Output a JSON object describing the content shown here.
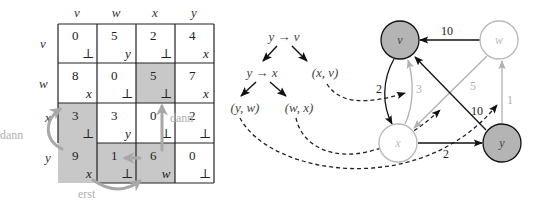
{
  "matrix": {
    "col_headers": [
      "v",
      "w",
      "x",
      "y"
    ],
    "row_headers": [
      "v",
      "w",
      "x",
      "y"
    ],
    "cells": [
      [
        {
          "d": "0",
          "p": "⊥"
        },
        {
          "d": "5",
          "p": "y"
        },
        {
          "d": "2",
          "p": "⊥"
        },
        {
          "d": "4",
          "p": "x"
        }
      ],
      [
        {
          "d": "8",
          "p": "x"
        },
        {
          "d": "0",
          "p": "⊥"
        },
        {
          "d": "5",
          "p": "⊥"
        },
        {
          "d": "7",
          "p": "x"
        }
      ],
      [
        {
          "d": "3",
          "p": "⊥"
        },
        {
          "d": "3",
          "p": "y"
        },
        {
          "d": "0",
          "p": "⊥"
        },
        {
          "d": "2",
          "p": "⊥"
        }
      ],
      [
        {
          "d": "9",
          "p": "x"
        },
        {
          "d": "1",
          "p": "⊥"
        },
        {
          "d": "6",
          "p": "w"
        },
        {
          "d": "0",
          "p": "⊥"
        }
      ]
    ],
    "shaded": [
      [
        1,
        2
      ],
      [
        2,
        0
      ],
      [
        3,
        0
      ],
      [
        3,
        1
      ],
      [
        3,
        2
      ]
    ],
    "annotations": {
      "left_arrow_label": "dann",
      "right_arrow_label": "dann",
      "bottom_arrow_label": "erst"
    }
  },
  "tree": {
    "root": "y → v",
    "left_child": "y → x",
    "right_leaf": "(x, v)",
    "leaf_left_left": "(y, w)",
    "leaf_left_right": "(w, x)"
  },
  "graph": {
    "nodes": [
      {
        "id": "v",
        "label": "v",
        "highlight": true
      },
      {
        "id": "w",
        "label": "w",
        "highlight": false
      },
      {
        "id": "x",
        "label": "x",
        "highlight": false
      },
      {
        "id": "y",
        "label": "y",
        "highlight": true
      }
    ],
    "edges": [
      {
        "from": "w",
        "to": "v",
        "weight": "10",
        "style": "dark"
      },
      {
        "from": "v",
        "to": "x",
        "weight": "2",
        "style": "dark"
      },
      {
        "from": "x",
        "to": "v",
        "weight": "3",
        "style": "light"
      },
      {
        "from": "w",
        "to": "x",
        "weight": "5",
        "style": "light"
      },
      {
        "from": "y",
        "to": "w",
        "weight": "1",
        "style": "light"
      },
      {
        "from": "y",
        "to": "v",
        "weight": "10",
        "style": "dark"
      },
      {
        "from": "x",
        "to": "y",
        "weight": "2",
        "style": "dark"
      }
    ]
  },
  "colors": {
    "shade": "#c8c8c8",
    "node_fill": "#b4b4b4",
    "light_line": "#b0b0b0",
    "dark_line": "#111111",
    "anno_arrow": "#a8a8a8",
    "anno_text": "#b0b0b0"
  }
}
